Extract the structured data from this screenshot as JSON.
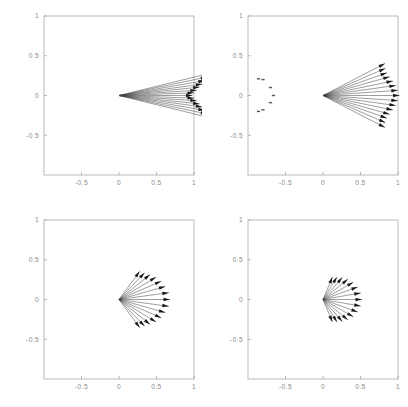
{
  "figure": {
    "layout": "2x2 grid of arrow (vector) plots",
    "panel_count": 4
  },
  "axes": {
    "xlabel": "",
    "ylabel": "",
    "xlim": [
      -1,
      1
    ],
    "ylim": [
      -1,
      1
    ],
    "xticks": [
      -0.5,
      0,
      0.5,
      1
    ],
    "xticklabels": [
      "-0.5",
      "0",
      "0.5",
      "1"
    ],
    "yticks": [
      -0.5,
      0,
      0.5,
      1
    ],
    "yticklabels": [
      "-0.5",
      "0",
      "0.5",
      "1"
    ],
    "grid": false,
    "frame_color": "#aaaaaa",
    "label_color": "#8a8a8a"
  },
  "chart_data": {
    "type": "scatter",
    "title": "",
    "subtitle": "",
    "xlabel": "",
    "ylabel": "",
    "xlim": [
      -1,
      1
    ],
    "ylim": [
      -1,
      1
    ],
    "grid": false,
    "legend": "none",
    "panels": [
      {
        "name": "panel-top-left",
        "index": 0,
        "origin": [
          0.0,
          0.0
        ],
        "arrow_count": 15,
        "angular_spread_deg": 13,
        "max_radius": 1.35,
        "min_radius": 0.95,
        "clipped_at_frame": true,
        "extra_marks": [],
        "arrows": [
          {
            "angle_deg": 13.0,
            "length": 1.25
          },
          {
            "angle_deg": 11.2,
            "length": 1.2
          },
          {
            "angle_deg": 9.3,
            "length": 1.16
          },
          {
            "angle_deg": 7.4,
            "length": 1.12
          },
          {
            "angle_deg": 5.6,
            "length": 1.08
          },
          {
            "angle_deg": 3.7,
            "length": 1.04
          },
          {
            "angle_deg": 1.9,
            "length": 1.0
          },
          {
            "angle_deg": 0.0,
            "length": 0.98
          },
          {
            "angle_deg": -1.9,
            "length": 1.0
          },
          {
            "angle_deg": -3.7,
            "length": 1.04
          },
          {
            "angle_deg": -5.6,
            "length": 1.08
          },
          {
            "angle_deg": -7.4,
            "length": 1.12
          },
          {
            "angle_deg": -9.3,
            "length": 1.16
          },
          {
            "angle_deg": -11.2,
            "length": 1.2
          },
          {
            "angle_deg": -13.0,
            "length": 1.25
          }
        ]
      },
      {
        "name": "panel-top-right",
        "index": 1,
        "origin": [
          0.0,
          0.0
        ],
        "arrow_count": 15,
        "angular_spread_deg": 26,
        "max_radius": 1.05,
        "min_radius": 0.8,
        "clipped_at_frame": true,
        "extra_marks": [
          {
            "x": -0.86,
            "y": 0.21
          },
          {
            "x": -0.8,
            "y": 0.2
          },
          {
            "x": -0.7,
            "y": 0.1
          },
          {
            "x": -0.66,
            "y": 0.0
          },
          {
            "x": -0.7,
            "y": -0.09
          },
          {
            "x": -0.8,
            "y": -0.18
          },
          {
            "x": -0.86,
            "y": -0.2
          }
        ],
        "arrows": [
          {
            "angle_deg": 26.0,
            "length": 0.92
          },
          {
            "angle_deg": 22.3,
            "length": 0.9
          },
          {
            "angle_deg": 18.6,
            "length": 0.9
          },
          {
            "angle_deg": 14.9,
            "length": 0.92
          },
          {
            "angle_deg": 11.1,
            "length": 0.95
          },
          {
            "angle_deg": 7.4,
            "length": 0.98
          },
          {
            "angle_deg": 3.7,
            "length": 1.0
          },
          {
            "angle_deg": 0.0,
            "length": 1.02
          },
          {
            "angle_deg": -3.7,
            "length": 1.0
          },
          {
            "angle_deg": -7.4,
            "length": 0.98
          },
          {
            "angle_deg": -11.1,
            "length": 0.95
          },
          {
            "angle_deg": -14.9,
            "length": 0.92
          },
          {
            "angle_deg": -18.6,
            "length": 0.9
          },
          {
            "angle_deg": -22.3,
            "length": 0.9
          },
          {
            "angle_deg": -26.0,
            "length": 0.92
          }
        ]
      },
      {
        "name": "panel-bottom-left",
        "index": 2,
        "origin": [
          0.0,
          0.0
        ],
        "arrow_count": 15,
        "angular_spread_deg": 52,
        "max_radius": 0.68,
        "min_radius": 0.44,
        "clipped_at_frame": false,
        "extra_marks": [],
        "arrows": [
          {
            "angle_deg": 52.0,
            "length": 0.45
          },
          {
            "angle_deg": 44.6,
            "length": 0.48
          },
          {
            "angle_deg": 37.1,
            "length": 0.52
          },
          {
            "angle_deg": 29.7,
            "length": 0.57
          },
          {
            "angle_deg": 22.3,
            "length": 0.61
          },
          {
            "angle_deg": 14.9,
            "length": 0.64
          },
          {
            "angle_deg": 7.4,
            "length": 0.67
          },
          {
            "angle_deg": 0.0,
            "length": 0.68
          },
          {
            "angle_deg": -7.4,
            "length": 0.67
          },
          {
            "angle_deg": -14.9,
            "length": 0.64
          },
          {
            "angle_deg": -22.3,
            "length": 0.61
          },
          {
            "angle_deg": -29.7,
            "length": 0.57
          },
          {
            "angle_deg": -37.1,
            "length": 0.52
          },
          {
            "angle_deg": -44.6,
            "length": 0.48
          },
          {
            "angle_deg": -52.0,
            "length": 0.45
          }
        ]
      },
      {
        "name": "panel-bottom-right",
        "index": 3,
        "origin": [
          0.0,
          0.0
        ],
        "arrow_count": 15,
        "angular_spread_deg": 66,
        "max_radius": 0.52,
        "min_radius": 0.3,
        "clipped_at_frame": false,
        "extra_marks": [],
        "arrows": [
          {
            "angle_deg": 66.0,
            "length": 0.31
          },
          {
            "angle_deg": 56.6,
            "length": 0.34
          },
          {
            "angle_deg": 47.1,
            "length": 0.38
          },
          {
            "angle_deg": 37.7,
            "length": 0.42
          },
          {
            "angle_deg": 28.3,
            "length": 0.46
          },
          {
            "angle_deg": 18.9,
            "length": 0.49
          },
          {
            "angle_deg": 9.4,
            "length": 0.51
          },
          {
            "angle_deg": 0.0,
            "length": 0.52
          },
          {
            "angle_deg": -9.4,
            "length": 0.51
          },
          {
            "angle_deg": -18.9,
            "length": 0.49
          },
          {
            "angle_deg": -28.3,
            "length": 0.46
          },
          {
            "angle_deg": -37.7,
            "length": 0.42
          },
          {
            "angle_deg": -47.1,
            "length": 0.38
          },
          {
            "angle_deg": -56.6,
            "length": 0.34
          },
          {
            "angle_deg": -66.0,
            "length": 0.31
          }
        ]
      }
    ]
  }
}
